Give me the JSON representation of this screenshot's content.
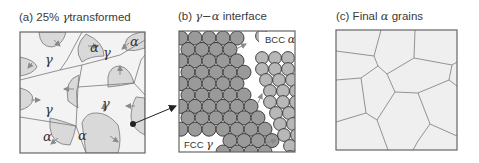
{
  "panels": [
    {
      "id": "a",
      "caption_prefix": "(a) 25% ",
      "caption_greek": "γ",
      "caption_suffix": "transformed",
      "labels": {
        "gamma": "γ",
        "alpha": "α"
      }
    },
    {
      "id": "b",
      "caption_prefix": "(b)  ",
      "caption_greek": "γ−α",
      "caption_suffix": " interface",
      "labels": {
        "bcc_prefix": "BCC ",
        "bcc_greek": "α",
        "fcc_prefix": "FCC ",
        "fcc_greek": "γ"
      }
    },
    {
      "id": "c",
      "caption_prefix": "(c) Final ",
      "caption_greek": "α",
      "caption_suffix": " grains"
    }
  ],
  "colors": {
    "grain_fill": "#f0f0f0",
    "alpha_fill": "#d9d9d9",
    "boundary": "#777777",
    "growth_arrow": "#8a8a8a",
    "fcc_atom": "#9a9a9a",
    "bcc_atom": "#b8b8b8",
    "atom_stroke": "#333333"
  }
}
